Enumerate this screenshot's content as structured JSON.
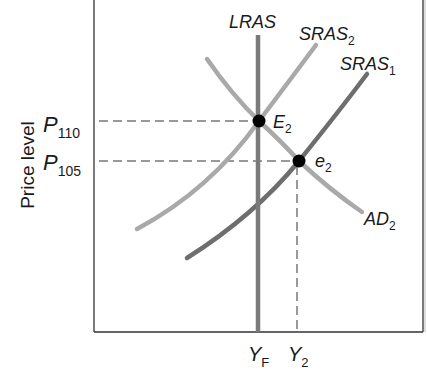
{
  "diagram": {
    "type": "AD-AS model",
    "y_axis_label": "Price level",
    "x_axis_ticks": [
      {
        "base": "Y",
        "sub": "F"
      },
      {
        "base": "Y",
        "sub": "2"
      }
    ],
    "y_axis_ticks": [
      {
        "base": "P",
        "sub": "110"
      },
      {
        "base": "P",
        "sub": "105"
      }
    ],
    "curves": {
      "lras": {
        "base": "LRAS",
        "sub": ""
      },
      "sras2": {
        "base": "SRAS",
        "sub": "2"
      },
      "sras1": {
        "base": "SRAS",
        "sub": "1"
      },
      "ad2": {
        "base": "AD",
        "sub": "2"
      }
    },
    "points": {
      "E2": {
        "base": "E",
        "sub": "2"
      },
      "e2": {
        "base": "e",
        "sub": "2"
      }
    },
    "colors": {
      "lras": "#7a7a7a",
      "sras2": "#a9a9a9",
      "sras1": "#6e6e6e",
      "ad2": "#a9a9a9",
      "axis": "#333333",
      "point": "#000000"
    }
  }
}
